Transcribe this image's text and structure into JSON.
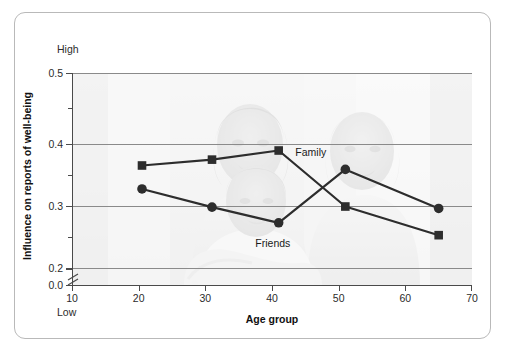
{
  "chart_data": {
    "type": "line",
    "title": "",
    "xlabel": "Age group",
    "ylabel": "Influence on reports of well-being",
    "xlim": [
      10,
      70
    ],
    "ylim": [
      0.0,
      0.5
    ],
    "y_axis_break": true,
    "y_break_between": [
      0.0,
      0.2
    ],
    "grid": "horizontal",
    "legend": "inline-annotations",
    "x_ticks": [
      "10",
      "20",
      "30",
      "40",
      "50",
      "60",
      "70"
    ],
    "y_ticks": [
      "0.0",
      "0.2",
      "0.3",
      "0.4",
      "0.5"
    ],
    "y_minor_ticks": [
      0.25,
      0.35,
      0.45
    ],
    "y_axis_high_label": "High",
    "y_axis_low_label": "Low",
    "x": [
      20.5,
      31,
      41,
      51,
      65
    ],
    "series": [
      {
        "name": "Family",
        "marker": "square",
        "color": "#2d2d2d",
        "values": [
          0.358,
          0.367,
          0.381,
          0.295,
          0.251
        ]
      },
      {
        "name": "Friends",
        "marker": "circle",
        "color": "#2d2d2d",
        "values": [
          0.322,
          0.294,
          0.27,
          0.352,
          0.292
        ]
      }
    ],
    "annotations": [
      {
        "text": "Family",
        "x": 43.5,
        "y": 0.378
      },
      {
        "text": "Friends",
        "x": 37.5,
        "y": 0.238
      }
    ],
    "background_image": "faded photograph of three generations of women smiling, a grandmother, a mother and a child embracing",
    "frame_color": "#b9b9b9",
    "gridline_color": "#8a8a8a",
    "axis_color": "#4a4a4a"
  }
}
